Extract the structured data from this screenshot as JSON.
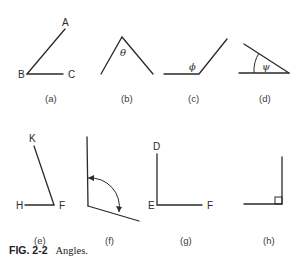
{
  "figure": {
    "caption_number": "FIG. 2-2",
    "caption_text": "Angles.",
    "panels": [
      {
        "id": "a",
        "sublabel": "(a)",
        "points": {
          "A": "A",
          "B": "B",
          "C": "C"
        }
      },
      {
        "id": "b",
        "sublabel": "(b)",
        "angle_symbol": "θ"
      },
      {
        "id": "c",
        "sublabel": "(c)",
        "angle_symbol": "ϕ"
      },
      {
        "id": "d",
        "sublabel": "(d)",
        "angle_symbol": "ψ"
      },
      {
        "id": "e",
        "sublabel": "(e)",
        "points": {
          "K": "K",
          "H": "H",
          "F": "F"
        }
      },
      {
        "id": "f",
        "sublabel": "(f)",
        "points": {
          "E": "E"
        }
      },
      {
        "id": "g",
        "sublabel": "(g)",
        "points": {
          "D": "D",
          "E": "E",
          "F": "F"
        }
      },
      {
        "id": "h",
        "sublabel": "(h)",
        "note": "right angle marker"
      }
    ]
  }
}
